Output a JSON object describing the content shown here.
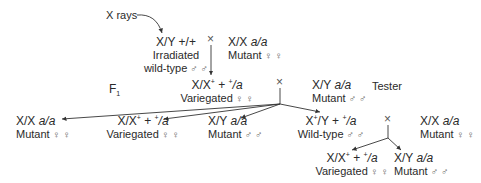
{
  "diagram": {
    "xrays_label": "X rays",
    "parents": {
      "male": {
        "genotype": "X/Y +/+",
        "line1": "Irradiated",
        "line2": "wild-type",
        "sex_symbol": "♂ ♂"
      },
      "female": {
        "genotype_prefix": "X/X ",
        "genotype_italic": "a/a",
        "phenotype": "Mutant",
        "sex_symbol": "♀ ♀"
      }
    },
    "generation_label": "F",
    "generation_sub": "1",
    "f1": {
      "female": {
        "geno_a": "X/X",
        "geno_sup": "+",
        "geno_b": " + ",
        "geno_sup2": "+",
        "geno_c": "/a",
        "phenotype": "Variegated",
        "sex_symbol": "♀ ♀"
      },
      "tester": {
        "genotype_prefix": "X/Y ",
        "genotype_italic": "a/a",
        "phenotype": "Mutant",
        "sex_symbol": "♂ ♂",
        "role_label": "Tester"
      }
    },
    "offspring": [
      {
        "genotype_prefix": "X/X ",
        "genotype_italic": "a/a",
        "phenotype": "Mutant",
        "sex_symbol": "♀ ♀"
      },
      {
        "geno_a": "X/X",
        "geno_sup": "+",
        "geno_b": " + ",
        "geno_sup2": "+",
        "geno_c": "/a",
        "phenotype": "Variegated",
        "sex_symbol": "♀ ♀"
      },
      {
        "genotype_prefix": "X/Y ",
        "genotype_italic": "a/a",
        "phenotype": "Mutant",
        "sex_symbol": "♂ ♂"
      },
      {
        "geno_a": "X",
        "geno_sup": "+",
        "geno_b": "/Y + ",
        "geno_sup2": "+",
        "geno_c": "/a",
        "phenotype": "Wild-type",
        "sex_symbol": "♂ ♂"
      }
    ],
    "second_cross_partner": {
      "genotype_prefix": "X/X ",
      "genotype_italic": "a/a",
      "phenotype": "Mutant",
      "sex_symbol": "♀ ♀"
    },
    "second_offspring": [
      {
        "geno_a": "X/X",
        "geno_sup": "+",
        "geno_b": " + ",
        "geno_sup2": "+",
        "geno_c": "/a",
        "phenotype": "Variegated",
        "sex_symbol": "♀ ♀"
      },
      {
        "genotype_prefix": "X/Y ",
        "genotype_italic": "a/a",
        "phenotype": "Mutant",
        "sex_symbol": "♂ ♂"
      }
    ],
    "cross_symbol": "×"
  }
}
